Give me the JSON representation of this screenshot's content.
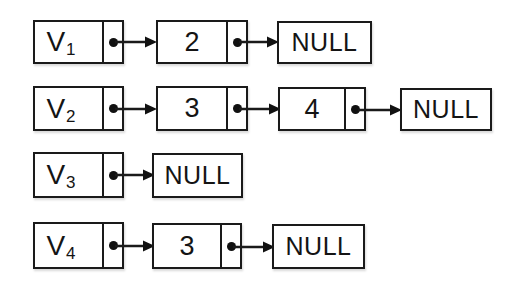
{
  "diagram": {
    "type": "linked-list",
    "background_color": "#ffffff",
    "line_color": "#1a1a1a",
    "text_color": "#141414",
    "null_text": "NULL",
    "pointer_icon": "filled-dot",
    "rows": [
      {
        "head": {
          "label": "V",
          "subscript": "1"
        },
        "nodes": [
          "2"
        ],
        "terminator": "NULL"
      },
      {
        "head": {
          "label": "V",
          "subscript": "2"
        },
        "nodes": [
          "3",
          "4"
        ],
        "terminator": "NULL"
      },
      {
        "head": {
          "label": "V",
          "subscript": "3"
        },
        "nodes": [],
        "terminator": "NULL"
      },
      {
        "head": {
          "label": "V",
          "subscript": "4"
        },
        "nodes": [
          "3"
        ],
        "terminator": "NULL"
      }
    ]
  }
}
